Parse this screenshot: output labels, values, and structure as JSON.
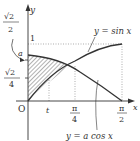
{
  "diagram": {
    "axes": {
      "x_label": "x",
      "y_label": "y",
      "origin_label": "O"
    },
    "y_ticks": {
      "one": "1",
      "a": "a",
      "sqrt2_over_2": {
        "num": "√2",
        "den": "2"
      },
      "sqrt2_over_4": {
        "num": "√2",
        "den": "4"
      }
    },
    "x_ticks": {
      "t": "t",
      "pi_over_4": {
        "num": "π",
        "den": "4"
      },
      "pi_over_2": {
        "num": "π",
        "den": "2"
      }
    },
    "curves": {
      "sin": {
        "label": "y = sin x"
      },
      "acos": {
        "label": "y = a cos x"
      }
    },
    "colors": {
      "stroke": "#333333",
      "dotted": "#777777",
      "hatch": "#555555"
    }
  }
}
